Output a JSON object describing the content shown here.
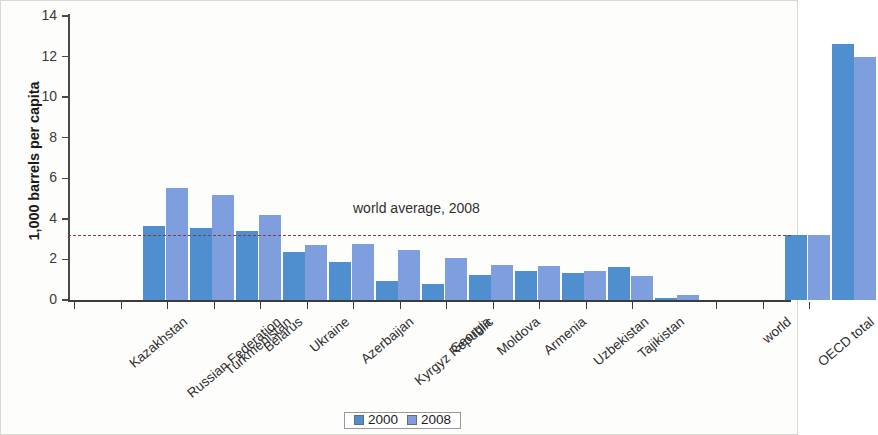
{
  "chart_data": {
    "type": "bar",
    "title": "",
    "xlabel": "",
    "ylabel": "1,000 barrels per capita",
    "ylim": [
      0,
      14
    ],
    "yticks": [
      0,
      2,
      4,
      6,
      8,
      10,
      12,
      14
    ],
    "grid": false,
    "legend_position": "bottom-center",
    "categories": [
      "Kazakhstan",
      "Russian Federation",
      "Turkmenistan",
      "Belarus",
      "Ukraine",
      "Azerbaijan",
      "Kyrgyz Republic",
      "Georgia",
      "Moldova",
      "Armenia",
      "Uzbekistan",
      "Tajikistan",
      "world",
      "OECD total"
    ],
    "series": [
      {
        "name": "2000",
        "color": "#4f8fd0",
        "values": [
          3.65,
          3.55,
          3.4,
          2.35,
          1.85,
          0.95,
          0.8,
          1.25,
          1.45,
          1.35,
          1.65,
          0.1,
          3.2,
          12.6
        ]
      },
      {
        "name": "2008",
        "color": "#7e9ede",
        "values": [
          5.5,
          5.2,
          4.2,
          2.7,
          2.75,
          2.45,
          2.05,
          1.75,
          1.7,
          1.45,
          1.2,
          0.25,
          3.2,
          12.0
        ]
      }
    ],
    "annotations": [
      {
        "name": "world-average-line",
        "label": "world average, 2008",
        "value": 3.2,
        "style": "dashed",
        "color": "#8d3a45"
      }
    ]
  },
  "legend": {
    "items": [
      {
        "label": "2000",
        "color": "#4f8fd0"
      },
      {
        "label": "2008",
        "color": "#7e9ede"
      }
    ]
  }
}
